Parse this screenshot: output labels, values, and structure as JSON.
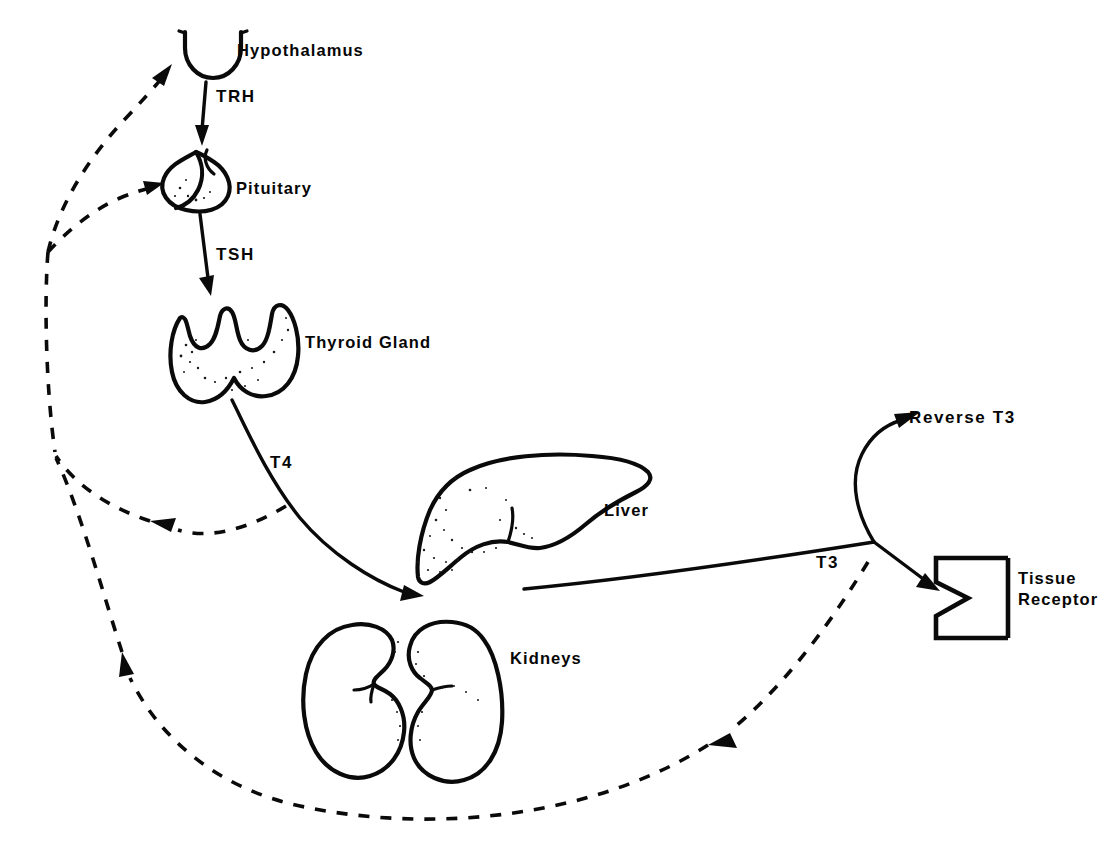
{
  "diagram": {
    "type": "flow-diagram",
    "background_color": "#ffffff",
    "ink_color": "#0a0a0a",
    "width": 1111,
    "height": 860
  },
  "organs": {
    "hypothalamus": {
      "label": "Hypothalamus",
      "x": 237,
      "y": 40
    },
    "pituitary": {
      "label": "Pituitary",
      "x": 236,
      "y": 178
    },
    "thyroid": {
      "label": "Thyroid Gland",
      "x": 305,
      "y": 332
    },
    "liver": {
      "label": "Liver",
      "x": 604,
      "y": 500
    },
    "kidneys": {
      "label": "Kidneys",
      "x": 510,
      "y": 648
    },
    "tissue_receptor": {
      "label": "Tissue\nReceptor",
      "x": 1018,
      "y": 580
    }
  },
  "hormones": {
    "trh": {
      "label": "TRH",
      "x": 216,
      "y": 86
    },
    "tsh": {
      "label": "TSH",
      "x": 216,
      "y": 244
    },
    "t4": {
      "label": "T4",
      "x": 270,
      "y": 452
    },
    "t3": {
      "label": "T3",
      "x": 816,
      "y": 552
    },
    "reverse_t3": {
      "label": "Reverse T3",
      "x": 909,
      "y": 407
    }
  },
  "connections": [
    {
      "name": "hypothalamus-to-pituitary",
      "label": "TRH",
      "style": "solid",
      "from": "hypothalamus",
      "to": "pituitary"
    },
    {
      "name": "pituitary-to-thyroid",
      "label": "TSH",
      "style": "solid",
      "from": "pituitary",
      "to": "thyroid"
    },
    {
      "name": "thyroid-to-liver",
      "label": "T4",
      "style": "solid",
      "from": "thyroid",
      "to": "liver"
    },
    {
      "name": "liver-to-reverse-t3",
      "label": "Reverse T3",
      "style": "solid",
      "from": "liver",
      "to": "reverse_t3"
    },
    {
      "name": "liver-to-tissue-receptor",
      "label": "T3",
      "style": "solid",
      "from": "liver",
      "to": "tissue_receptor"
    },
    {
      "name": "t4-feedback-loop",
      "label": "",
      "style": "dashed",
      "from": "t4",
      "to": "hypothalamus-pituitary"
    },
    {
      "name": "t3-feedback-loop",
      "label": "",
      "style": "dashed",
      "from": "t3",
      "to": "hypothalamus-pituitary"
    },
    {
      "name": "feedback-to-hypothalamus",
      "label": "",
      "style": "dashed",
      "from": "feedback-trunk",
      "to": "hypothalamus"
    },
    {
      "name": "feedback-to-pituitary",
      "label": "",
      "style": "dashed",
      "from": "feedback-trunk",
      "to": "pituitary"
    }
  ]
}
